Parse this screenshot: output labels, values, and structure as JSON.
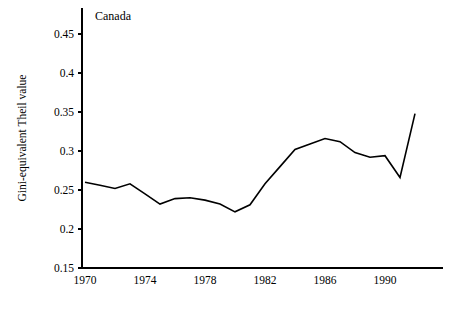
{
  "figure": {
    "background": "#ffffff",
    "line_color": "#000000",
    "axis_color": "#000000"
  },
  "chart_data": {
    "type": "line",
    "title": "",
    "series_label": "Canada",
    "xlabel": "",
    "ylabel": "Gini-equivalent Theil value",
    "xlim": [
      1969,
      1993
    ],
    "ylim": [
      0.15,
      0.47
    ],
    "grid": false,
    "legend": "none",
    "xticks": [
      1970,
      1974,
      1978,
      1982,
      1986,
      1990
    ],
    "xtick_labels": [
      "1970",
      "1974",
      "1978",
      "1982",
      "1986",
      "1990"
    ],
    "yticks": [
      0.15,
      0.2,
      0.25,
      0.3,
      0.35,
      0.4,
      0.45
    ],
    "ytick_labels": [
      "0.15",
      "0.2",
      "0.25",
      "0.3",
      "0.35",
      "0.4",
      "0.45"
    ],
    "x": [
      1970,
      1971,
      1972,
      1973,
      1974,
      1975,
      1976,
      1977,
      1978,
      1979,
      1980,
      1981,
      1982,
      1983,
      1984,
      1985,
      1986,
      1987,
      1988,
      1989,
      1990,
      1991,
      1992
    ],
    "series": [
      {
        "name": "Canada",
        "values": [
          0.26,
          0.256,
          0.252,
          0.258,
          0.245,
          0.232,
          0.239,
          0.24,
          0.237,
          0.232,
          0.222,
          0.231,
          0.258,
          0.28,
          0.302,
          0.309,
          0.316,
          0.312,
          0.298,
          0.292,
          0.294,
          0.266,
          0.348
        ]
      }
    ]
  }
}
